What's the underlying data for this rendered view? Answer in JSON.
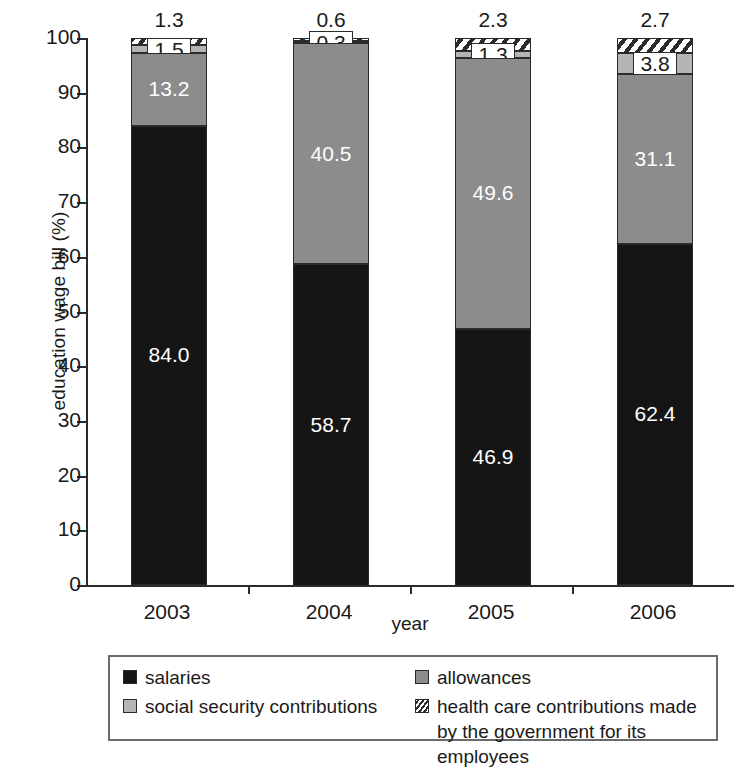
{
  "chart_data": {
    "type": "bar",
    "subtype": "stacked-bar-100",
    "title": "",
    "xlabel": "year",
    "ylabel": "education wage bill (%)",
    "categories": [
      "2003",
      "2004",
      "2005",
      "2006"
    ],
    "ylim": [
      0,
      100
    ],
    "yticks": [
      0,
      10,
      20,
      30,
      40,
      50,
      60,
      70,
      80,
      90,
      100
    ],
    "ytick_labels": [
      "0",
      "10",
      "20",
      "30",
      "40",
      "50",
      "60",
      "70",
      "80",
      "90",
      "100"
    ],
    "grid": false,
    "legend_position": "bottom",
    "stack_order_bottom_to_top": [
      "salaries",
      "social security contributions",
      "allowances",
      "health care contributions made by the government for its employees"
    ],
    "series": [
      {
        "name": "salaries",
        "color": "#151515",
        "values": [
          84.0,
          58.7,
          46.9,
          62.4
        ],
        "labels": [
          "84.0",
          "58.7",
          "46.9",
          "62.4"
        ]
      },
      {
        "name": "social security contributions",
        "color": "#8c8c8c",
        "values": [
          13.2,
          40.5,
          49.6,
          31.1
        ],
        "labels": [
          "13.2",
          "40.5",
          "49.6",
          "31.1"
        ]
      },
      {
        "name": "allowances",
        "color": "#b4b4b4",
        "values": [
          1.5,
          0.3,
          1.3,
          3.8
        ],
        "labels": [
          "1.5",
          "0.3",
          "1.3",
          "3.8"
        ]
      },
      {
        "name": "health care contributions made by the government for its employees",
        "color": "hatched",
        "values": [
          1.3,
          0.6,
          2.3,
          2.7
        ],
        "labels": [
          "1.3",
          "0.6",
          "2.3",
          "2.7"
        ]
      }
    ],
    "top_annotations": [
      "1.3",
      "0.6",
      "2.3",
      "2.7"
    ]
  },
  "axes": {
    "y_title": "education wage bill (%)",
    "x_title": "year",
    "y_ticks": [
      "100",
      "90",
      "80",
      "70",
      "60",
      "50",
      "40",
      "30",
      "20",
      "10",
      "0"
    ],
    "x_ticks": [
      "2003",
      "2004",
      "2005",
      "2006"
    ]
  },
  "bars": [
    {
      "category": "2003",
      "top_label": "1.3",
      "segments": [
        {
          "name": "health",
          "label": "1.3",
          "value": 1.3,
          "boxed": false,
          "hidden_label": true
        },
        {
          "name": "allowances",
          "label": "1.5",
          "value": 1.5,
          "boxed": true,
          "hidden_label": false
        },
        {
          "name": "social",
          "label": "13.2",
          "value": 13.2,
          "boxed": false,
          "hidden_label": false
        },
        {
          "name": "salaries",
          "label": "84.0",
          "value": 84.0,
          "boxed": false,
          "hidden_label": false
        }
      ]
    },
    {
      "category": "2004",
      "top_label": "0.6",
      "segments": [
        {
          "name": "health",
          "label": "0.6",
          "value": 0.6,
          "boxed": false,
          "hidden_label": true
        },
        {
          "name": "allowances",
          "label": "0.3",
          "value": 0.3,
          "boxed": true,
          "hidden_label": false
        },
        {
          "name": "social",
          "label": "40.5",
          "value": 40.5,
          "boxed": false,
          "hidden_label": false
        },
        {
          "name": "salaries",
          "label": "58.7",
          "value": 58.7,
          "boxed": false,
          "hidden_label": false
        }
      ]
    },
    {
      "category": "2005",
      "top_label": "2.3",
      "segments": [
        {
          "name": "health",
          "label": "2.3",
          "value": 2.3,
          "boxed": false,
          "hidden_label": true
        },
        {
          "name": "allowances",
          "label": "1.3",
          "value": 1.3,
          "boxed": true,
          "hidden_label": false
        },
        {
          "name": "social",
          "label": "49.6",
          "value": 49.6,
          "boxed": false,
          "hidden_label": false
        },
        {
          "name": "salaries",
          "label": "46.9",
          "value": 46.9,
          "boxed": false,
          "hidden_label": false
        }
      ]
    },
    {
      "category": "2006",
      "top_label": "2.7",
      "segments": [
        {
          "name": "health",
          "label": "2.7",
          "value": 2.7,
          "boxed": false,
          "hidden_label": true
        },
        {
          "name": "allowances",
          "label": "3.8",
          "value": 3.8,
          "boxed": true,
          "hidden_label": false
        },
        {
          "name": "social",
          "label": "31.1",
          "value": 31.1,
          "boxed": false,
          "hidden_label": false
        },
        {
          "name": "salaries",
          "label": "62.4",
          "value": 62.4,
          "boxed": false,
          "hidden_label": false
        }
      ]
    }
  ],
  "legend": {
    "items": [
      {
        "key": "salaries",
        "label": "salaries",
        "swatch": "solid-black"
      },
      {
        "key": "allowances",
        "label": "allowances",
        "swatch": "solid-dark-gray"
      },
      {
        "key": "social",
        "label": "social security contributions",
        "swatch": "solid-light-gray"
      },
      {
        "key": "health",
        "label": "health care contributions made by the government for its employees",
        "swatch": "hatched"
      }
    ]
  },
  "colors": {
    "salaries": "#151515",
    "social": "#8c8c8c",
    "allowances": "#b4b4b4",
    "axis": "#2b2b2b",
    "text": "#1a1a1a",
    "background": "#ffffff"
  }
}
